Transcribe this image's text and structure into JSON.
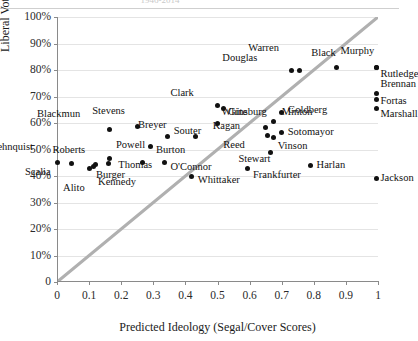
{
  "figure": {
    "title_remnant": "1946-2014",
    "x_axis_title": "Predicted Ideology (Segal/Cover Scores)",
    "y_axis_title": "Liberal Votes in Economics Cases",
    "point_color": "#111111",
    "refline_color": "#b0b0b0",
    "grid_color": "#e4e4e4",
    "axis_color": "#8a8a8a"
  },
  "chart_data": {
    "type": "scatter",
    "title": "",
    "xlabel": "Predicted Ideology (Segal/Cover Scores)",
    "ylabel": "Liberal Votes in Economics Cases",
    "xlim": [
      0,
      1
    ],
    "ylim": [
      0,
      1
    ],
    "xticks": [
      "0",
      "0.1",
      "0.2",
      "0.3",
      "0.4",
      "0.5",
      "0.6",
      "0.7",
      "0.8",
      "0.9",
      "1"
    ],
    "xtick_values": [
      0,
      0.1,
      0.2,
      0.3,
      0.4,
      0.5,
      0.6,
      0.7,
      0.8,
      0.9,
      1
    ],
    "yticks": [
      "0",
      "10%",
      "20%",
      "30%",
      "40%",
      "50%",
      "60%",
      "70%",
      "80%",
      "90%",
      "100%"
    ],
    "ytick_values": [
      0,
      0.1,
      0.2,
      0.3,
      0.4,
      0.5,
      0.6,
      0.7,
      0.8,
      0.9,
      1
    ],
    "grid": "horizontal",
    "legend": "none",
    "reference_line": {
      "description": "45-degree diagonal y = x",
      "from": [
        0,
        0
      ],
      "to": [
        1,
        1
      ]
    },
    "points": [
      {
        "name": "Rehnquist",
        "x": 0.045,
        "y": 0.447,
        "label_dx": -44,
        "label_dy": -17
      },
      {
        "name": "Roberts",
        "x": 0.12,
        "y": 0.442,
        "label_dx": -16,
        "label_dy": -15
      },
      {
        "name": "Scalia",
        "x": 0.0,
        "y": 0.45,
        "label_dx": -12,
        "label_dy": 9
      },
      {
        "name": "Alito",
        "x": 0.1,
        "y": 0.43,
        "label_dx": -10,
        "label_dy": 20
      },
      {
        "name": "Burger",
        "x": 0.115,
        "y": 0.436,
        "label_dx": 2,
        "label_dy": 9
      },
      {
        "name": "Powell",
        "x": 0.165,
        "y": 0.465,
        "label_dx": 6,
        "label_dy": -14
      },
      {
        "name": "Thomas",
        "x": 0.16,
        "y": 0.447,
        "label_dx": 10,
        "label_dy": 1
      },
      {
        "name": "Blackmun",
        "x": 0.165,
        "y": 0.575,
        "label_dx": -36,
        "label_dy": -16
      },
      {
        "name": "Kennedy",
        "x": 0.265,
        "y": 0.452,
        "label_dx": -12,
        "label_dy": 20
      },
      {
        "name": "Stevens",
        "x": 0.25,
        "y": 0.588,
        "label_dx": -18,
        "label_dy": -15
      },
      {
        "name": "Burton",
        "x": 0.29,
        "y": 0.512,
        "label_dx": 6,
        "label_dy": 4
      },
      {
        "name": "Souter",
        "x": 0.345,
        "y": 0.55,
        "label_dx": 6,
        "label_dy": -5
      },
      {
        "name": "Breyer",
        "x": 0.43,
        "y": 0.548,
        "label_dx": -34,
        "label_dy": -12
      },
      {
        "name": "O'Connor",
        "x": 0.335,
        "y": 0.452,
        "label_dx": 6,
        "label_dy": 5
      },
      {
        "name": "Whittaker",
        "x": 0.42,
        "y": 0.398,
        "label_dx": 6,
        "label_dy": 3
      },
      {
        "name": "Clark",
        "x": 0.5,
        "y": 0.665,
        "label_dx": -30,
        "label_dy": -13
      },
      {
        "name": "Ginsburg",
        "x": 0.52,
        "y": 0.655,
        "label_dx": 4,
        "label_dy": 4
      },
      {
        "name": "White",
        "x": 0.5,
        "y": 0.6,
        "label_dx": 4,
        "label_dy": -11
      },
      {
        "name": "Kagan",
        "x": 0.65,
        "y": 0.583,
        "label_dx": -32,
        "label_dy": -2
      },
      {
        "name": "Reed",
        "x": 0.655,
        "y": 0.552,
        "label_dx": -28,
        "label_dy": 9
      },
      {
        "name": "Frankfurter",
        "x": 0.595,
        "y": 0.428,
        "label_dx": 5,
        "label_dy": 6
      },
      {
        "name": "Douglas",
        "x": 0.73,
        "y": 0.8,
        "label_dx": -40,
        "label_dy": -12
      },
      {
        "name": "Warren",
        "x": 0.755,
        "y": 0.8,
        "label_dx": -26,
        "label_dy": -22
      },
      {
        "name": "Minton",
        "x": 0.675,
        "y": 0.605,
        "label_dx": 8,
        "label_dy": -10
      },
      {
        "name": "Goldberg",
        "x": 0.7,
        "y": 0.64,
        "label_dx": 6,
        "label_dy": -2
      },
      {
        "name": "Sotomayor",
        "x": 0.7,
        "y": 0.565,
        "label_dx": 6,
        "label_dy": 0
      },
      {
        "name": "Vinson",
        "x": 0.675,
        "y": 0.545,
        "label_dx": 4,
        "label_dy": 8
      },
      {
        "name": "Stewart",
        "x": 0.665,
        "y": 0.487,
        "label_dx": -6,
        "label_dy": 6
      },
      {
        "name": "Harlan",
        "x": 0.79,
        "y": 0.44,
        "label_dx": 6,
        "label_dy": 0
      },
      {
        "name": "Black",
        "x": 0.87,
        "y": 0.81,
        "label_dx": -6,
        "label_dy": -14
      },
      {
        "name": "Murphy",
        "x": 0.995,
        "y": 0.81,
        "label_dx": -8,
        "label_dy": -16
      },
      {
        "name": "Rutledge",
        "x": 0.995,
        "y": 0.81,
        "label_dx": 4,
        "label_dy": 7
      },
      {
        "name": "Brennan",
        "x": 0.995,
        "y": 0.712,
        "label_dx": 4,
        "label_dy": -9
      },
      {
        "name": "Fortas",
        "x": 0.995,
        "y": 0.69,
        "label_dx": 4,
        "label_dy": 2
      },
      {
        "name": "Marshall",
        "x": 0.995,
        "y": 0.655,
        "label_dx": 4,
        "label_dy": 6
      },
      {
        "name": "Jackson",
        "x": 0.995,
        "y": 0.392,
        "label_dx": 4,
        "label_dy": 0
      }
    ]
  }
}
